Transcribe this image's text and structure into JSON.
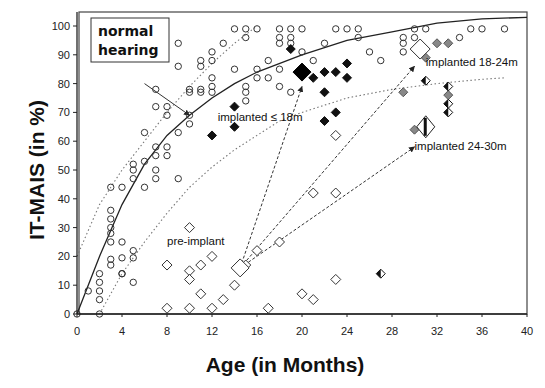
{
  "chart_data": {
    "type": "scatter",
    "title": "",
    "xlabel": "Age (in Months)",
    "ylabel": "IT-MAIS (in %)",
    "xlim": [
      0,
      40
    ],
    "ylim": [
      0,
      100
    ],
    "xticks": [
      0,
      4,
      8,
      12,
      16,
      20,
      24,
      28,
      32,
      36,
      40
    ],
    "yticks": [
      0,
      10,
      20,
      30,
      40,
      50,
      60,
      70,
      80,
      90,
      100
    ],
    "grid": false,
    "legend_box": "normal\nhearing",
    "annotations": [
      {
        "text": "normal hearing",
        "x": 2.5,
        "y": 94
      },
      {
        "text": "pre-implant",
        "x": 8,
        "y": 24
      },
      {
        "text": "implanted ≤ 18m",
        "x": 12.5,
        "y": 67
      },
      {
        "text": "implanted 18-24m",
        "x": 31,
        "y": 86
      },
      {
        "text": "implanted 24-30m",
        "x": 30,
        "y": 57
      }
    ],
    "series": [
      {
        "name": "normal hearing",
        "marker": "open-circle",
        "points": [
          [
            0,
            0
          ],
          [
            1,
            8
          ],
          [
            2,
            14
          ],
          [
            2,
            11
          ],
          [
            2,
            8
          ],
          [
            2,
            5
          ],
          [
            2,
            0
          ],
          [
            3,
            36
          ],
          [
            3,
            33
          ],
          [
            3,
            30
          ],
          [
            3,
            28
          ],
          [
            3,
            25
          ],
          [
            3,
            19
          ],
          [
            3,
            17
          ],
          [
            4,
            25
          ],
          [
            4,
            19.5
          ],
          [
            4,
            14
          ],
          [
            4,
            14
          ],
          [
            5,
            22
          ],
          [
            5,
            19.5
          ],
          [
            5,
            11
          ],
          [
            3,
            44
          ],
          [
            4,
            44
          ],
          [
            5,
            52
          ],
          [
            5,
            50
          ],
          [
            5,
            47
          ],
          [
            6,
            44
          ],
          [
            6,
            53
          ],
          [
            6,
            63
          ],
          [
            7,
            58
          ],
          [
            7,
            55
          ],
          [
            7,
            50
          ],
          [
            7,
            47
          ],
          [
            8,
            58
          ],
          [
            8,
            55
          ],
          [
            9,
            47
          ],
          [
            7,
            78
          ],
          [
            7,
            72
          ],
          [
            8,
            72
          ],
          [
            8,
            69
          ],
          [
            9,
            63
          ],
          [
            10,
            78
          ],
          [
            10,
            69
          ],
          [
            10,
            66
          ],
          [
            9,
            94
          ],
          [
            9,
            86
          ],
          [
            11,
            88
          ],
          [
            11,
            86
          ],
          [
            11,
            78
          ],
          [
            10,
            77
          ],
          [
            11,
            77
          ],
          [
            12,
            91
          ],
          [
            12,
            88
          ],
          [
            12,
            82
          ],
          [
            12,
            79
          ],
          [
            12,
            77
          ],
          [
            13,
            94
          ],
          [
            14,
            99
          ],
          [
            15,
            99
          ],
          [
            16,
            99
          ],
          [
            15,
            96
          ],
          [
            14,
            85
          ],
          [
            15,
            79
          ],
          [
            15,
            77
          ],
          [
            15,
            74
          ],
          [
            16,
            85
          ],
          [
            16,
            82
          ],
          [
            17,
            82
          ],
          [
            17,
            88
          ],
          [
            18,
            99
          ],
          [
            19,
            99
          ],
          [
            20,
            99
          ],
          [
            18,
            96
          ],
          [
            19,
            96
          ],
          [
            18,
            94
          ],
          [
            19,
            94
          ],
          [
            18,
            85
          ],
          [
            18,
            79
          ],
          [
            19,
            77
          ],
          [
            20,
            91
          ],
          [
            21,
            88
          ],
          [
            22,
            94
          ],
          [
            23,
            99
          ],
          [
            24,
            99
          ],
          [
            25,
            99
          ],
          [
            25,
            96
          ],
          [
            26,
            91
          ],
          [
            27,
            88
          ],
          [
            29,
            96
          ],
          [
            29,
            94
          ],
          [
            29,
            91
          ],
          [
            30,
            99
          ],
          [
            31,
            99
          ],
          [
            30,
            96
          ],
          [
            34,
            96
          ],
          [
            35,
            99
          ],
          [
            36,
            99
          ],
          [
            38,
            99
          ]
        ]
      },
      {
        "name": "pre-implant",
        "marker": "open-diamond",
        "points": [
          [
            8,
            17
          ],
          [
            8,
            2
          ],
          [
            10,
            30
          ],
          [
            10,
            15
          ],
          [
            10,
            12
          ],
          [
            10,
            2
          ],
          [
            11,
            17
          ],
          [
            11,
            7
          ],
          [
            12,
            20
          ],
          [
            12,
            2
          ],
          [
            13,
            5
          ],
          [
            14,
            10
          ],
          [
            15,
            17
          ],
          [
            16,
            22
          ],
          [
            17,
            2
          ],
          [
            18,
            25
          ],
          [
            20,
            7
          ],
          [
            21,
            5
          ],
          [
            23,
            12
          ],
          [
            21,
            42
          ],
          [
            23,
            42
          ],
          [
            23,
            62
          ]
        ],
        "group_mean": [
          14.5,
          16
        ]
      },
      {
        "name": "implanted ≤ 18m",
        "marker": "filled-diamond",
        "points": [
          [
            12,
            62
          ],
          [
            14,
            72
          ],
          [
            14,
            65
          ],
          [
            19,
            92
          ],
          [
            21,
            82
          ],
          [
            22,
            84
          ],
          [
            23,
            84
          ],
          [
            24,
            87
          ],
          [
            24,
            82
          ],
          [
            22,
            77
          ],
          [
            23,
            70
          ],
          [
            22,
            67
          ]
        ],
        "group_mean": [
          20,
          84
        ]
      },
      {
        "name": "implanted 18-24m",
        "marker": "grey-diamond",
        "points": [
          [
            32,
            94
          ],
          [
            33,
            94
          ],
          [
            31,
            89
          ],
          [
            29,
            77
          ],
          [
            33,
            76
          ],
          [
            30,
            64
          ]
        ],
        "group_mean": [
          30.5,
          92
        ]
      },
      {
        "name": "implanted 24-30m",
        "marker": "half-filled-diamond",
        "points": [
          [
            31,
            81
          ],
          [
            33,
            79
          ],
          [
            33,
            73
          ],
          [
            33,
            70
          ],
          [
            27,
            14
          ]
        ],
        "group_mean": [
          31,
          65
        ]
      }
    ],
    "curves": [
      {
        "name": "normal hearing fit",
        "style": "solid",
        "points": [
          [
            0,
            0
          ],
          [
            2,
            20
          ],
          [
            4,
            38
          ],
          [
            6,
            52
          ],
          [
            8,
            62
          ],
          [
            10,
            69
          ],
          [
            12,
            75
          ],
          [
            14,
            80
          ],
          [
            16,
            84
          ],
          [
            20,
            90
          ],
          [
            24,
            95
          ],
          [
            28,
            98
          ],
          [
            32,
            101
          ],
          [
            36,
            102.5
          ],
          [
            40,
            103
          ]
        ]
      },
      {
        "name": "upper bound",
        "style": "dotted",
        "points": [
          [
            0,
            20
          ],
          [
            2,
            38
          ],
          [
            4,
            50
          ],
          [
            6,
            60
          ],
          [
            8,
            70
          ],
          [
            10,
            79
          ],
          [
            12,
            87
          ],
          [
            14,
            94
          ],
          [
            16,
            100
          ]
        ]
      },
      {
        "name": "lower bound",
        "style": "dotted",
        "points": [
          [
            2,
            0
          ],
          [
            4,
            14
          ],
          [
            6,
            25
          ],
          [
            8,
            35
          ],
          [
            10,
            44
          ],
          [
            12,
            51
          ],
          [
            14,
            57
          ],
          [
            16,
            62
          ],
          [
            18,
            67
          ],
          [
            20,
            70
          ],
          [
            24,
            75
          ],
          [
            28,
            78
          ],
          [
            32,
            80
          ],
          [
            36,
            81.5
          ],
          [
            38,
            82
          ]
        ]
      }
    ],
    "arrows": [
      {
        "from": [
          14.5,
          16
        ],
        "to": [
          20,
          79
        ],
        "style": "dashed"
      },
      {
        "from": [
          14.5,
          16
        ],
        "to": [
          30,
          86
        ],
        "style": "dashed"
      },
      {
        "from": [
          14.5,
          16
        ],
        "to": [
          30,
          58
        ],
        "style": "dashed"
      },
      {
        "from": [
          6,
          80
        ],
        "to": [
          10,
          69
        ],
        "style": "solid"
      }
    ]
  }
}
